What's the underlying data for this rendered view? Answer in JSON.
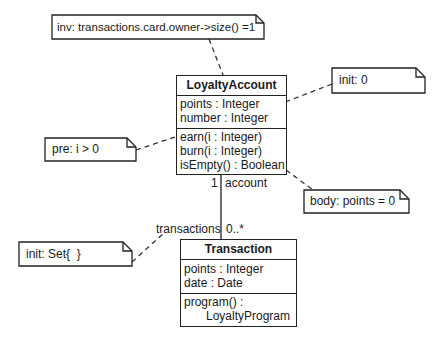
{
  "diagram": {
    "type": "UML class diagram with OCL notes",
    "classes": [
      {
        "name": "LoyaltyAccount",
        "attributes": [
          "points : Integer",
          "number : Integer"
        ],
        "operations": [
          "earn(i : Integer)",
          "burn(i : Integer)",
          "isEmpty() : Boolean"
        ]
      },
      {
        "name": "Transaction",
        "attributes": [
          "points : Integer",
          "date : Date"
        ],
        "operations": [
          "program() :",
          "LoyaltyProgram"
        ]
      }
    ],
    "association": {
      "end_account": {
        "multiplicity": "1",
        "role": "account"
      },
      "end_transactions": {
        "multiplicity": "0..*",
        "role": "transactions"
      }
    },
    "notes": {
      "inv": "inv: transactions.card.owner->size() =1",
      "init_points": "init: 0",
      "pre_earn": "pre: i > 0",
      "body_isempty": "body: points = 0",
      "init_transactions": "init: Set{  }"
    }
  }
}
